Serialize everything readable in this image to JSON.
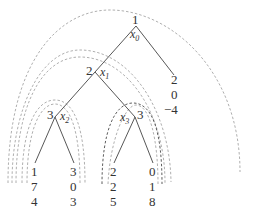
{
  "nodes": [
    {
      "id": "root",
      "value": "1",
      "var": "x",
      "var_sub": "0"
    },
    {
      "id": "n1",
      "value": "2",
      "var": "x",
      "var_sub": "1"
    },
    {
      "id": "n2",
      "value": "3",
      "var": "x",
      "var_sub": "2"
    },
    {
      "id": "n3",
      "value": "3",
      "var": "x",
      "var_sub": "3"
    }
  ],
  "leaves": [
    {
      "id": "leaf-root-right",
      "values": [
        "2",
        "0",
        "−4"
      ]
    },
    {
      "id": "leaf-x2-left",
      "values": [
        "1",
        "7",
        "4"
      ]
    },
    {
      "id": "leaf-x2-right",
      "values": [
        "3",
        "0",
        "3"
      ]
    },
    {
      "id": "leaf-x3-left",
      "values": [
        "2",
        "2",
        "5"
      ]
    },
    {
      "id": "leaf-x3-right",
      "values": [
        "0",
        "1",
        "8"
      ]
    }
  ],
  "edges": [
    [
      "root",
      "n1"
    ],
    [
      "root",
      "leaf-root-right"
    ],
    [
      "n1",
      "n2"
    ],
    [
      "n1",
      "n3"
    ],
    [
      "n2",
      "leaf-x2-left"
    ],
    [
      "n2",
      "leaf-x2-right"
    ],
    [
      "n3",
      "leaf-x3-left"
    ],
    [
      "n3",
      "leaf-x3-right"
    ]
  ],
  "arcs": [
    {
      "name": "arc-root",
      "style": "gray"
    },
    {
      "name": "arc-x1",
      "style": "gray"
    },
    {
      "name": "arc-x1-outer",
      "style": "gray"
    },
    {
      "name": "arc-x2",
      "style": "gray"
    },
    {
      "name": "arc-x2-outer",
      "style": "gray"
    },
    {
      "name": "arc-x3",
      "style": "dark"
    },
    {
      "name": "arc-x3-outer",
      "style": "gray"
    }
  ],
  "colors": {
    "edge": "#444444",
    "arc_gray": "#9a9a9a",
    "arc_dark": "#333333",
    "text": "#333333"
  }
}
